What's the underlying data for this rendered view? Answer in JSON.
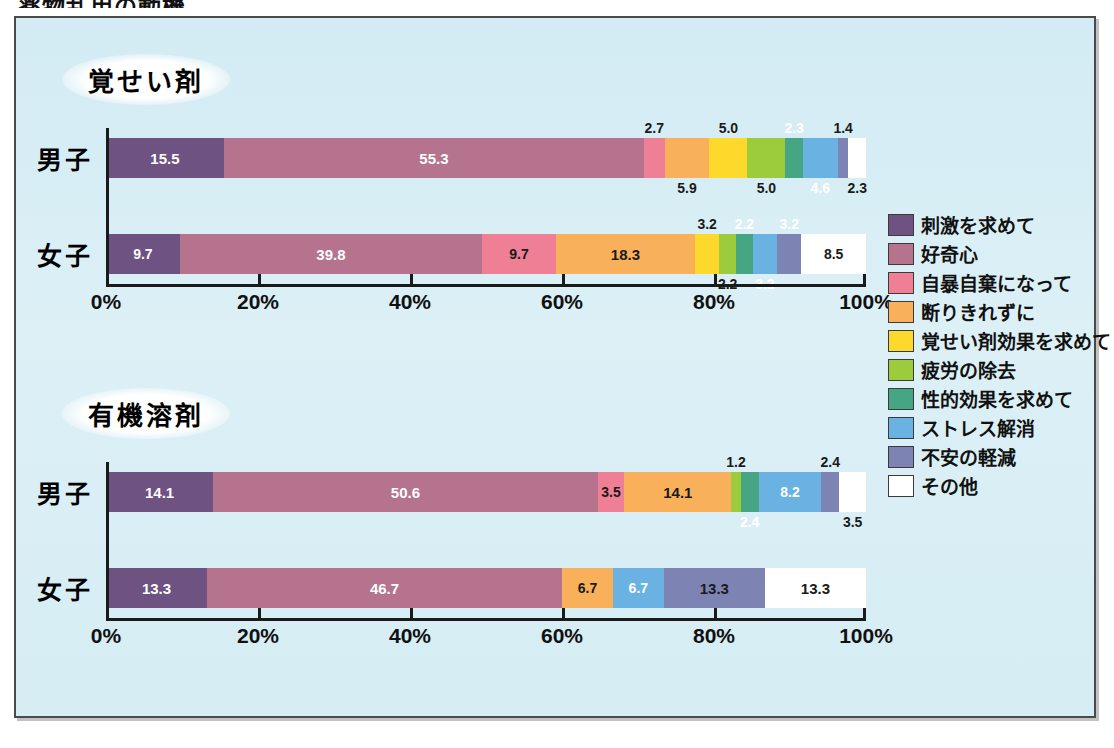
{
  "doc_title": "薬物乱用の動機",
  "sections": [
    {
      "name": "覚せい剤"
    },
    {
      "name": "有機溶剤"
    }
  ],
  "axis": {
    "ticks": [
      "0%",
      "20%",
      "40%",
      "60%",
      "80%",
      "100%"
    ],
    "values": [
      0,
      20,
      40,
      60,
      80,
      100
    ]
  },
  "legend": [
    {
      "label": "刺激を求めて",
      "color": "#6d5282"
    },
    {
      "label": "好奇心",
      "color": "#b5738e"
    },
    {
      "label": "自暴自棄になって",
      "color": "#ef7f95"
    },
    {
      "label": "断りきれずに",
      "color": "#f9b05b"
    },
    {
      "label": "覚せい剤効果を求めて",
      "color": "#fcd92b"
    },
    {
      "label": "疲労の除去",
      "color": "#9ccb3b"
    },
    {
      "label": "性的効果を求めて",
      "color": "#46a583"
    },
    {
      "label": "ストレス解消",
      "color": "#6ab2e2"
    },
    {
      "label": "不安の軽減",
      "color": "#7d84b4"
    },
    {
      "label": "その他",
      "color": "#ffffff"
    }
  ],
  "chart_data": {
    "type": "bar",
    "subtype": "stacked-horizontal-100",
    "title": "薬物乱用の動機",
    "xlabel": "",
    "ylabel": "",
    "xlim": [
      0,
      100
    ],
    "tick_labels": [
      "0%",
      "20%",
      "40%",
      "60%",
      "80%",
      "100%"
    ],
    "grid": false,
    "legend_position": "right",
    "categories": [
      "刺激を求めて",
      "好奇心",
      "自暴自棄になって",
      "断りきれずに",
      "覚せい剤効果を求めて",
      "疲労の除去",
      "性的効果を求めて",
      "ストレス解消",
      "不安の軽減",
      "その他"
    ],
    "panels": [
      {
        "name": "覚せい剤",
        "rows": [
          {
            "label": "男子",
            "total": 100,
            "segments": [
              {
                "cat": "刺激を求めて",
                "value": 15.5,
                "label": "15.5",
                "color": "#6d5282",
                "text": "light",
                "pos": "in"
              },
              {
                "cat": "好奇心",
                "value": 55.3,
                "label": "55.3",
                "color": "#b5738e",
                "text": "light",
                "pos": "in"
              },
              {
                "cat": "自暴自棄になって",
                "value": 2.7,
                "label": "2.7",
                "color": "#ef7f95",
                "text": "dark",
                "pos": "up"
              },
              {
                "cat": "断りきれずに",
                "value": 5.9,
                "label": "5.9",
                "color": "#f9b05b",
                "text": "dark",
                "pos": "down"
              },
              {
                "cat": "覚せい剤効果を求めて",
                "value": 5.0,
                "label": "5.0",
                "color": "#fcd92b",
                "text": "dark",
                "pos": "up"
              },
              {
                "cat": "疲労の除去",
                "value": 5.0,
                "label": "5.0",
                "color": "#9ccb3b",
                "text": "dark",
                "pos": "down"
              },
              {
                "cat": "性的効果を求めて",
                "value": 2.3,
                "label": "2.3",
                "color": "#46a583",
                "text": "light",
                "pos": "up"
              },
              {
                "cat": "ストレス解消",
                "value": 4.6,
                "label": "4.6",
                "color": "#6ab2e2",
                "text": "light",
                "pos": "down"
              },
              {
                "cat": "不安の軽減",
                "value": 1.4,
                "label": "1.4",
                "color": "#7d84b4",
                "text": "dark",
                "pos": "up"
              },
              {
                "cat": "その他",
                "value": 2.3,
                "label": "2.3",
                "color": "#ffffff",
                "text": "dark",
                "pos": "down"
              }
            ]
          },
          {
            "label": "女子",
            "total": 100,
            "segments": [
              {
                "cat": "刺激を求めて",
                "value": 9.7,
                "label": "9.7",
                "color": "#6d5282",
                "text": "light",
                "pos": "in"
              },
              {
                "cat": "好奇心",
                "value": 39.8,
                "label": "39.8",
                "color": "#b5738e",
                "text": "light",
                "pos": "in"
              },
              {
                "cat": "自暴自棄になって",
                "value": 9.7,
                "label": "9.7",
                "color": "#ef7f95",
                "text": "dark",
                "pos": "in"
              },
              {
                "cat": "断りきれずに",
                "value": 18.3,
                "label": "18.3",
                "color": "#f9b05b",
                "text": "dark",
                "pos": "in"
              },
              {
                "cat": "覚せい剤効果を求めて",
                "value": 3.2,
                "label": "3.2",
                "color": "#fcd92b",
                "text": "dark",
                "pos": "up"
              },
              {
                "cat": "疲労の除去",
                "value": 2.2,
                "label": "2.2",
                "color": "#9ccb3b",
                "text": "dark",
                "pos": "down"
              },
              {
                "cat": "性的効果を求めて",
                "value": 2.2,
                "label": "2.2",
                "color": "#46a583",
                "text": "light",
                "pos": "up"
              },
              {
                "cat": "ストレス解消",
                "value": 3.2,
                "label": "3.2",
                "color": "#6ab2e2",
                "text": "light",
                "pos": "down"
              },
              {
                "cat": "不安の軽減",
                "value": 3.2,
                "label": "3.2",
                "color": "#7d84b4",
                "text": "light",
                "pos": "up"
              },
              {
                "cat": "その他",
                "value": 8.5,
                "label": "8.5",
                "color": "#ffffff",
                "text": "dark",
                "pos": "in"
              }
            ]
          }
        ]
      },
      {
        "name": "有機溶剤",
        "rows": [
          {
            "label": "男子",
            "total": 100,
            "segments": [
              {
                "cat": "刺激を求めて",
                "value": 14.1,
                "label": "14.1",
                "color": "#6d5282",
                "text": "light",
                "pos": "in"
              },
              {
                "cat": "好奇心",
                "value": 50.6,
                "label": "50.6",
                "color": "#b5738e",
                "text": "light",
                "pos": "in"
              },
              {
                "cat": "自暴自棄になって",
                "value": 3.5,
                "label": "3.5",
                "color": "#ef7f95",
                "text": "dark",
                "pos": "in"
              },
              {
                "cat": "断りきれずに",
                "value": 14.1,
                "label": "14.1",
                "color": "#f9b05b",
                "text": "dark",
                "pos": "in"
              },
              {
                "cat": "疲労の除去",
                "value": 1.2,
                "label": "1.2",
                "color": "#9ccb3b",
                "text": "dark",
                "pos": "up"
              },
              {
                "cat": "性的効果を求めて",
                "value": 2.4,
                "label": "2.4",
                "color": "#46a583",
                "text": "light",
                "pos": "down"
              },
              {
                "cat": "ストレス解消",
                "value": 8.2,
                "label": "8.2",
                "color": "#6ab2e2",
                "text": "light",
                "pos": "in"
              },
              {
                "cat": "不安の軽減",
                "value": 2.4,
                "label": "2.4",
                "color": "#7d84b4",
                "text": "dark",
                "pos": "up"
              },
              {
                "cat": "その他",
                "value": 3.5,
                "label": "3.5",
                "color": "#ffffff",
                "text": "dark",
                "pos": "down"
              }
            ]
          },
          {
            "label": "女子",
            "total": 100,
            "segments": [
              {
                "cat": "刺激を求めて",
                "value": 13.3,
                "label": "13.3",
                "color": "#6d5282",
                "text": "light",
                "pos": "in"
              },
              {
                "cat": "好奇心",
                "value": 46.7,
                "label": "46.7",
                "color": "#b5738e",
                "text": "light",
                "pos": "in"
              },
              {
                "cat": "断りきれずに",
                "value": 6.7,
                "label": "6.7",
                "color": "#f9b05b",
                "text": "dark",
                "pos": "in"
              },
              {
                "cat": "ストレス解消",
                "value": 6.7,
                "label": "6.7",
                "color": "#6ab2e2",
                "text": "light",
                "pos": "in"
              },
              {
                "cat": "不安の軽減",
                "value": 13.3,
                "label": "13.3",
                "color": "#7d84b4",
                "text": "dark",
                "pos": "in"
              },
              {
                "cat": "その他",
                "value": 13.3,
                "label": "13.3",
                "color": "#ffffff",
                "text": "dark",
                "pos": "in"
              }
            ]
          }
        ]
      }
    ]
  }
}
